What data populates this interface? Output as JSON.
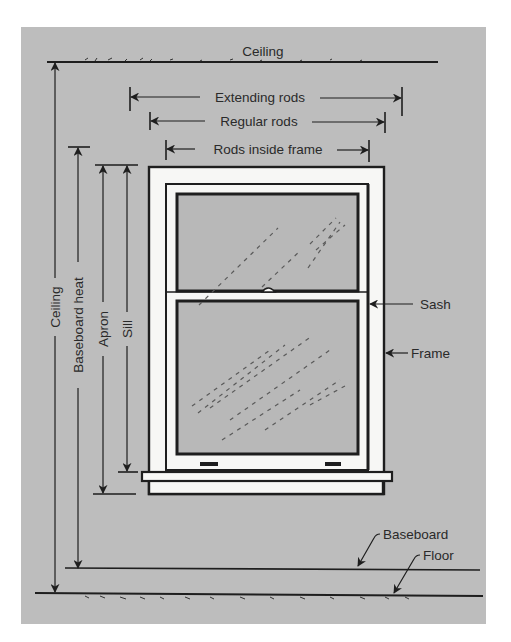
{
  "diagram": {
    "colors": {
      "background": "#ffffff",
      "wall": "#bdbdbd",
      "ink": "#1e1e1e",
      "window_white": "#f7f7f5",
      "glass": "#b8b8b8"
    },
    "labels": {
      "ceiling_top": "Ceiling",
      "extending_rods": "Extending rods",
      "regular_rods": "Regular rods",
      "rods_inside_frame": "Rods inside frame",
      "sash": "Sash",
      "frame": "Frame",
      "baseboard": "Baseboard",
      "floor": "Floor",
      "ceiling_vertical": "Ceiling",
      "baseboard_heat": "Baseboard heat",
      "apron": "Apron",
      "sill": "Sill"
    }
  }
}
